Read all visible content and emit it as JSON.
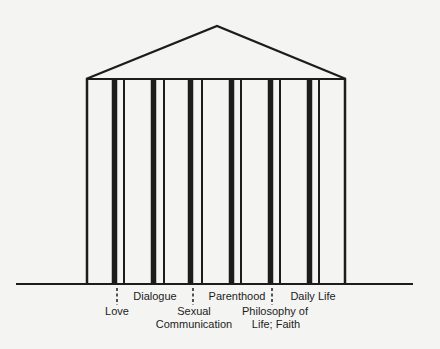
{
  "diagram": {
    "type": "temple-pillars",
    "colors": {
      "ink": "#1c1c1c",
      "background": "#f4f4f2"
    },
    "roof": {
      "apex": [
        217,
        26
      ],
      "left": [
        86,
        79
      ],
      "right": [
        346,
        79
      ]
    },
    "frame": {
      "left_x": 87,
      "right_x": 345,
      "top_y": 79,
      "bottom_y": 284
    },
    "ground": {
      "x1": 16,
      "x2": 413,
      "y": 284
    },
    "pillars": [
      {
        "thick_x": 114.5,
        "thin_x": 124
      },
      {
        "thick_x": 153.5,
        "thin_x": 164
      },
      {
        "thick_x": 190.5,
        "thin_x": 202
      },
      {
        "thick_x": 231.5,
        "thin_x": 241
      },
      {
        "thick_x": 270.5,
        "thin_x": 280
      },
      {
        "thick_x": 309.5,
        "thin_x": 319
      }
    ],
    "markers": [
      {
        "x": 117,
        "y1": 288,
        "y2": 305
      },
      {
        "x": 193,
        "y1": 288,
        "y2": 305
      },
      {
        "x": 272,
        "y1": 288,
        "y2": 305
      }
    ],
    "labels": [
      {
        "text": "Love",
        "x": 117,
        "y": 305
      },
      {
        "text": "Dialogue",
        "x": 155,
        "y": 290
      },
      {
        "text": "Sexual",
        "x": 194,
        "y": 305
      },
      {
        "text": "Communication",
        "x": 194,
        "y": 318
      },
      {
        "text": "Parenthood",
        "x": 237,
        "y": 290
      },
      {
        "text": "Philosophy of",
        "x": 275,
        "y": 305
      },
      {
        "text": "Life; Faith",
        "x": 276,
        "y": 318
      },
      {
        "text": "Daily Life",
        "x": 313,
        "y": 290
      }
    ]
  }
}
